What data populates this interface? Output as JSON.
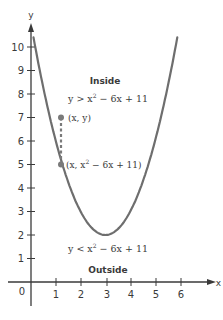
{
  "chart_data": {
    "type": "line",
    "title": "",
    "xlabel": "x",
    "ylabel": "y",
    "xlim": [
      -0.3,
      6.8
    ],
    "ylim": [
      -1.2,
      11
    ],
    "x_ticks": [
      "0",
      "1",
      "2",
      "3",
      "4",
      "5",
      "6"
    ],
    "y_ticks": [
      "1",
      "2",
      "3",
      "4",
      "5",
      "6",
      "7",
      "8",
      "9",
      "10"
    ],
    "grid": false,
    "series": [
      {
        "name": "y = x^2 - 6x + 11",
        "function": "x^2 - 6x + 11",
        "x": [
          0,
          0.5,
          1,
          1.5,
          2,
          2.5,
          3,
          3.5,
          4,
          4.5,
          5,
          5.5,
          6
        ],
        "values": [
          11,
          8.25,
          6,
          4.25,
          3,
          2.25,
          2,
          2.25,
          3,
          4.25,
          6,
          8.25,
          11
        ],
        "vertex": [
          3,
          2
        ]
      }
    ],
    "points": [
      {
        "label": "(x, y)",
        "x": 1.2,
        "y": 7
      },
      {
        "label": "(x, x² − 6x + 11)",
        "x": 1.2,
        "y": 5
      }
    ],
    "annotations": [
      {
        "text": "Inside",
        "x": 3,
        "y": 8.6
      },
      {
        "text": "y > x² − 6x + 11",
        "x": 3,
        "y": 7.8
      },
      {
        "text": "y < x² − 6x + 11",
        "x": 3.2,
        "y": 1.2
      },
      {
        "text": "Outside",
        "x": 3.3,
        "y": 0.4
      }
    ]
  },
  "labels": {
    "x_axis": "x",
    "y_axis": "y",
    "origin": "0",
    "inside_title": "Inside",
    "inside_ineq_prefix": "y > x",
    "inside_ineq_suffix": " − 6x + 11",
    "outside_title": "Outside",
    "outside_ineq_prefix": "y < x",
    "outside_ineq_suffix": " − 6x + 11",
    "point_upper": "(x, y)",
    "point_lower_prefix": "(x, x",
    "point_lower_suffix": " − 6x + 11)",
    "sup2": "2"
  },
  "colors": {
    "curve": "#6e6e6e",
    "axis": "#3a3a3a",
    "point": "#7a7a7a"
  }
}
